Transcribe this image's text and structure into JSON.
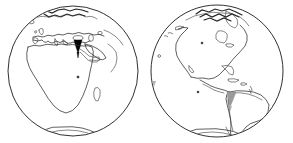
{
  "figure": {
    "background_color": "#ffffff",
    "outline_color": "#1a1a1a",
    "width": 293,
    "height": 143
  },
  "globes": [
    {
      "id": "eastern-hemisphere",
      "label": "Eastern Hemisphere",
      "center_x": 73,
      "center_y": 71,
      "radius": 65,
      "landmasses": [
        "Europe",
        "Africa",
        "Arabian Peninsula",
        "Middle East",
        "Western Asia",
        "Madagascar",
        "Scandinavia",
        "Iceland",
        "British Isles",
        "Mediterranean Sea",
        "Antarctica edge"
      ],
      "highlight": {
        "name": "eastern-mediterranean-highlight",
        "color": "#000000",
        "style": "filled-black",
        "region": "Egypt / Eastern Mediterranean"
      }
    },
    {
      "id": "western-hemisphere",
      "label": "Western Hemisphere",
      "center_x": 217,
      "center_y": 71,
      "radius": 66,
      "landmasses": [
        "North America",
        "Greenland",
        "Canadian Arctic",
        "Central America",
        "Caribbean",
        "South America",
        "Alaska",
        "Antarctica edge"
      ],
      "highlight": {
        "name": "south-america-west-coast-highlight",
        "color": "#9a9a9a",
        "style": "filled-gray",
        "region": "Peru / Chile west coast"
      }
    }
  ],
  "legend": {
    "black_marker_meaning": "Highlighted region (Eastern Hemisphere)",
    "gray_marker_meaning": "Highlighted region (Western Hemisphere)"
  }
}
